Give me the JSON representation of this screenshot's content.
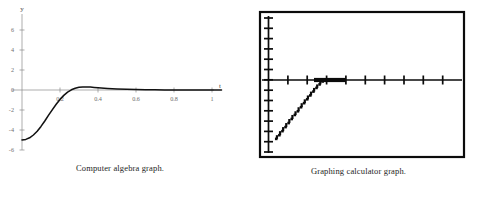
{
  "figures": [
    {
      "id": "computer-algebra",
      "caption": "Computer algebra graph."
    },
    {
      "id": "graphing-calculator",
      "caption": "Graphing calculator graph."
    }
  ],
  "chart_data": [
    {
      "type": "line",
      "id": "computer-algebra-graph",
      "title": "",
      "subtitle": "",
      "xlabel": "t",
      "ylabel": "y",
      "xlim": [
        0,
        1.06
      ],
      "ylim": [
        -7,
        7
      ],
      "grid": false,
      "legend": "none",
      "style": "computer-algebra-system",
      "axis_color": "#8a8a8a",
      "curve_color": "#111111",
      "xticks": [
        0.2,
        0.4,
        0.6,
        0.8,
        1
      ],
      "xtick_labels": [
        "0.2",
        "0.4",
        "0.6",
        "0.8",
        "1"
      ],
      "yticks": [
        -6,
        -4,
        -2,
        0,
        2,
        4,
        6
      ],
      "ytick_labels": [
        "-6",
        "-4",
        "-2",
        "0",
        "2",
        "4",
        "6"
      ],
      "annotations": [
        "curve starts near y = -5 at t = 0",
        "crosses y = 0 near t = 0.25",
        "small positive bump peaking near t = 0.32",
        "decays toward y = 0 for large t"
      ],
      "series": [
        {
          "name": "y(t)",
          "x": [
            0.0,
            0.02,
            0.04,
            0.06,
            0.08,
            0.1,
            0.12,
            0.14,
            0.16,
            0.18,
            0.2,
            0.22,
            0.24,
            0.26,
            0.28,
            0.3,
            0.32,
            0.34,
            0.36,
            0.38,
            0.4,
            0.45,
            0.5,
            0.55,
            0.6,
            0.65,
            0.7,
            0.75,
            0.8,
            0.85,
            0.9,
            0.95,
            1.0,
            1.05
          ],
          "values": [
            -5.0,
            -4.94,
            -4.78,
            -4.5,
            -4.12,
            -3.64,
            -3.1,
            -2.52,
            -1.96,
            -1.42,
            -0.94,
            -0.54,
            -0.22,
            0.02,
            0.18,
            0.27,
            0.31,
            0.31,
            0.29,
            0.26,
            0.23,
            0.16,
            0.11,
            0.07,
            0.05,
            0.03,
            0.02,
            0.01,
            0.01,
            0.0,
            0.0,
            0.0,
            0.0,
            0.0
          ]
        }
      ]
    },
    {
      "type": "line",
      "id": "graphing-calculator-graph",
      "title": "",
      "subtitle": "",
      "xlabel": "",
      "ylabel": "",
      "grid": false,
      "legend": "none",
      "style": "graphing-calculator-screen",
      "frame_color": "#0b0b0b",
      "axis_color": "#0b0b0b",
      "curve_color": "#0b0b0b",
      "xlim": [
        0,
        1
      ],
      "ylim": [
        -0.78,
        0.72
      ],
      "x_axis_tick_count": 9,
      "y_axis_tick_count": 14,
      "xtick_labels": [],
      "ytick_labels": [],
      "annotations": [
        "pixelated staircase curve rising from lower-left to the x-axis",
        "thick bold overlap where the plotted curve coincides with the axis"
      ],
      "series": [
        {
          "name": "y(t)",
          "x": [
            0.04,
            0.056,
            0.072,
            0.088,
            0.104,
            0.12,
            0.136,
            0.152,
            0.168,
            0.184,
            0.2,
            0.216,
            0.232,
            0.248,
            0.264,
            0.28,
            0.32,
            0.4,
            0.5,
            0.6,
            0.7,
            0.8,
            0.9,
            1.0
          ],
          "values": [
            -0.64,
            -0.6,
            -0.556,
            -0.512,
            -0.468,
            -0.424,
            -0.38,
            -0.34,
            -0.296,
            -0.252,
            -0.21,
            -0.168,
            -0.126,
            -0.086,
            -0.048,
            -0.016,
            0.0,
            0.0,
            0.0,
            0.0,
            0.0,
            0.0,
            0.0,
            0.0
          ]
        }
      ]
    }
  ]
}
